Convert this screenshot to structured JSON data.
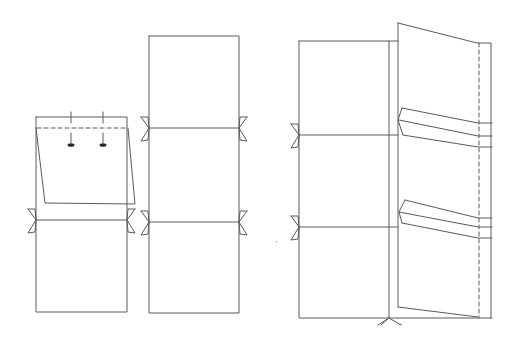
{
  "diagram": {
    "stroke_color": "#5a5a5a",
    "background": "#ffffff",
    "figures": [
      {
        "name": "left-figure-flap-with-pins",
        "shapes": [
          {
            "type": "polyline",
            "points": "36,117 127,117 127,312 36,312 36,117"
          },
          {
            "type": "line",
            "points": "36,220 126,220"
          },
          {
            "type": "polyline",
            "points": "36,128 45,203 135,204 128,128",
            "fill": "#ffffff"
          },
          {
            "type": "line",
            "points": "37,128 127,128",
            "dashed": true
          },
          {
            "type": "line",
            "points": "71,112 71,123"
          },
          {
            "type": "line",
            "points": "103,112 103,123"
          },
          {
            "type": "line",
            "points": "71,133 71,143"
          },
          {
            "type": "line",
            "points": "103,133 103,143"
          },
          {
            "type": "ellipse",
            "cx": 71,
            "cy": 145,
            "rx": 3.5,
            "ry": 1.8
          },
          {
            "type": "ellipse",
            "cx": 103,
            "cy": 145,
            "rx": 3.5,
            "ry": 1.8
          },
          {
            "type": "bowtie",
            "x": 36,
            "y": 220,
            "dir": -1
          },
          {
            "type": "bowtie",
            "x": 127,
            "y": 220,
            "dir": 1
          }
        ]
      },
      {
        "name": "middle-figure-three-panels",
        "shapes": [
          {
            "type": "polyline",
            "points": "149,36 239,36 239,313 149,313 149,36"
          },
          {
            "type": "line",
            "points": "149,128 239,128"
          },
          {
            "type": "line",
            "points": "149,222 239,222"
          },
          {
            "type": "bowtie",
            "x": 149,
            "y": 128,
            "dir": -1
          },
          {
            "type": "bowtie",
            "x": 239,
            "y": 128,
            "dir": 1
          },
          {
            "type": "bowtie",
            "x": 149,
            "y": 222,
            "dir": -1
          },
          {
            "type": "bowtie",
            "x": 239,
            "y": 222,
            "dir": 1
          }
        ]
      },
      {
        "name": "right-figure-pocket-panel",
        "shapes": [
          {
            "type": "polyline",
            "points": "299,41 389,41 389,318 299,318 299,41"
          },
          {
            "type": "line",
            "points": "389,41 398,41"
          },
          {
            "type": "line",
            "points": "299,135 398,135"
          },
          {
            "type": "line",
            "points": "299,227 398,227"
          },
          {
            "type": "line",
            "points": "389,318 492,318"
          },
          {
            "type": "polyline",
            "points": "398,23 477,43 491,43 491,318"
          },
          {
            "type": "line",
            "points": "398,23 398,307"
          },
          {
            "type": "line",
            "points": "398,307 478,317"
          },
          {
            "type": "line",
            "points": "479,43 479,318",
            "dashed": true
          },
          {
            "type": "polyline",
            "points": "402,108 478,123 492,123"
          },
          {
            "type": "polyline",
            "points": "402,108 398,120 403,135"
          },
          {
            "type": "polyline",
            "points": "399,120 478,136 492,136"
          },
          {
            "type": "polyline",
            "points": "403,135 478,147 492,147"
          },
          {
            "type": "polyline",
            "points": "405,200 478,218 492,218"
          },
          {
            "type": "polyline",
            "points": "405,200 399,212 402,223"
          },
          {
            "type": "polyline",
            "points": "399,212 478,227 492,227"
          },
          {
            "type": "polyline",
            "points": "402,223 478,238 492,238"
          },
          {
            "type": "bowtie",
            "x": 299,
            "y": 135,
            "dir": -1
          },
          {
            "type": "bowtie",
            "x": 299,
            "y": 227,
            "dir": -1
          },
          {
            "type": "bowtie-down",
            "x": 389,
            "y": 318
          }
        ]
      }
    ],
    "stray_mark": {
      "x": 276,
      "y": 241
    }
  }
}
